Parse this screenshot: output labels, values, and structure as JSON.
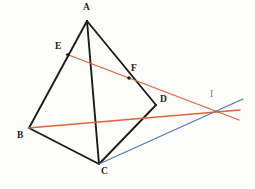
{
  "figure": {
    "type": "geometry-diagram",
    "canvas": {
      "width": 255,
      "height": 189,
      "background": "#fdfdfb"
    },
    "colors": {
      "edge_black": "#1c1c1c",
      "line_orange": "#e0633a",
      "line_blue": "#4a7ab5",
      "label_black": "#1c1c1c",
      "label_orange": "#d4603a"
    },
    "points": [
      {
        "id": "A",
        "label": "A",
        "x": 87,
        "y": 21,
        "label_x": 83,
        "label_y": 3,
        "color": "black",
        "dot": false
      },
      {
        "id": "B",
        "label": "B",
        "x": 29,
        "y": 128,
        "label_x": 17,
        "label_y": 131,
        "color": "black",
        "dot": false
      },
      {
        "id": "C",
        "label": "C",
        "x": 99,
        "y": 164,
        "label_x": 101,
        "label_y": 167,
        "color": "black",
        "dot": false
      },
      {
        "id": "D",
        "label": "D",
        "x": 156,
        "y": 105,
        "label_x": 160,
        "label_y": 95,
        "color": "black",
        "dot": false
      },
      {
        "id": "E",
        "label": "E",
        "x": 68,
        "y": 55,
        "label_x": 55,
        "label_y": 42,
        "color": "black",
        "dot": true
      },
      {
        "id": "F",
        "label": "F",
        "x": 129,
        "y": 78,
        "label_x": 131,
        "label_y": 64,
        "color": "black",
        "dot": true
      },
      {
        "id": "I",
        "label": "I",
        "x": 215,
        "y": 112,
        "label_x": 210,
        "label_y": 89,
        "color": "orange",
        "dot": false
      }
    ],
    "edges": [
      {
        "id": "AB",
        "from": "A",
        "to": "B",
        "color": "edge_black",
        "width": 1.9
      },
      {
        "id": "AC",
        "from": "A",
        "to": "C",
        "color": "edge_black",
        "width": 1.9
      },
      {
        "id": "AD",
        "from": "A",
        "to": "D",
        "color": "edge_black",
        "width": 1.9
      },
      {
        "id": "BC",
        "from": "B",
        "to": "C",
        "color": "edge_black",
        "width": 1.9
      },
      {
        "id": "CD",
        "from": "C",
        "to": "D",
        "color": "edge_black",
        "width": 1.9
      }
    ],
    "rays": [
      {
        "id": "EFI",
        "label": "line through E, F extended to I",
        "color": "line_orange",
        "width": 1.3,
        "x1": 66,
        "y1": 54,
        "x2": 239,
        "y2": 120
      },
      {
        "id": "BDI",
        "label": "line through B, D extended to I",
        "color": "line_orange",
        "width": 1.3,
        "x1": 28,
        "y1": 128,
        "x2": 240,
        "y2": 110
      },
      {
        "id": "CI",
        "label": "line through C extended to I",
        "color": "line_blue",
        "width": 1.3,
        "x1": 99,
        "y1": 164,
        "x2": 243,
        "y2": 99
      }
    ]
  }
}
